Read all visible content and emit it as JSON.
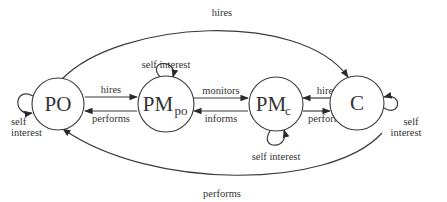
{
  "diagram": {
    "nodes": [
      {
        "id": "PO",
        "label": "PO",
        "sub": "",
        "cx": 58,
        "cy": 104,
        "r": 26
      },
      {
        "id": "PMpo",
        "label": "PM",
        "sub": "po",
        "cx": 166,
        "cy": 104,
        "r": 28
      },
      {
        "id": "PMc",
        "label": "PM",
        "sub": "c",
        "cx": 276,
        "cy": 104,
        "r": 27
      },
      {
        "id": "C",
        "label": "C",
        "sub": "",
        "cx": 357,
        "cy": 103,
        "r": 27
      }
    ],
    "edges": [
      {
        "from": "PO",
        "to": "C",
        "label": "hires"
      },
      {
        "from": "PO",
        "to": "PMpo",
        "label": "hires"
      },
      {
        "from": "PMpo",
        "to": "PO",
        "label": "performs"
      },
      {
        "from": "PMpo",
        "to": "PMc",
        "label": "monitors"
      },
      {
        "from": "PMc",
        "to": "PMpo",
        "label": "informs"
      },
      {
        "from": "C",
        "to": "PMc",
        "label": "hires"
      },
      {
        "from": "PMc",
        "to": "C",
        "label": "performs"
      },
      {
        "from": "C",
        "to": "PO",
        "label": "performs"
      }
    ],
    "self_loops": [
      {
        "node": "PO",
        "label_line1": "self",
        "label_line2": "interest"
      },
      {
        "node": "PMpo",
        "label": "self interest"
      },
      {
        "node": "PMc",
        "label": "self interest"
      },
      {
        "node": "C",
        "label_line1": "self",
        "label_line2": "interest"
      }
    ]
  }
}
